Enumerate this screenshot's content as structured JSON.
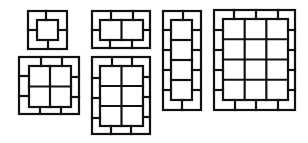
{
  "diagram": {
    "stroke_color": "#111111",
    "background": "#ffffff",
    "figures": [
      {
        "id": "fig-1x1",
        "cols": 1,
        "rows": 1,
        "outer": [
          28,
          11,
          67,
          49
        ],
        "inner": [
          37,
          20,
          58,
          40
        ],
        "border_ticks": {
          "top": [
            46
          ],
          "bottom": [
            48
          ],
          "left": [
            30
          ],
          "right": [
            30
          ]
        }
      },
      {
        "id": "fig-2x1",
        "cols": 2,
        "rows": 1,
        "outer": [
          92,
          11,
          150,
          48
        ],
        "inner": [
          100,
          20,
          143,
          40
        ],
        "border_ticks": {
          "top": [
            111,
            133
          ],
          "bottom": [
            110,
            132
          ],
          "left": [
            30
          ],
          "right": [
            30
          ]
        }
      },
      {
        "id": "fig-2x2",
        "cols": 2,
        "rows": 2,
        "outer": [
          19,
          57,
          79,
          114
        ],
        "inner": [
          29,
          66,
          71,
          107
        ],
        "border_ticks": {
          "top": [
            41,
            62
          ],
          "bottom": [
            40,
            61
          ],
          "left": [
            76,
            96
          ],
          "right": [
            77,
            97
          ]
        }
      },
      {
        "id": "fig-2x3",
        "cols": 2,
        "rows": 3,
        "outer": [
          92,
          57,
          150,
          134
        ],
        "inner": [
          100,
          66,
          143,
          126
        ],
        "border_ticks": {
          "top": [
            112,
            132
          ],
          "bottom": [
            111,
            131
          ],
          "left": [
            78,
            98,
            118
          ],
          "right": [
            77,
            97,
            117
          ]
        }
      },
      {
        "id": "fig-1x4",
        "cols": 1,
        "rows": 4,
        "outer": [
          163,
          11,
          201,
          110
        ],
        "inner": [
          171,
          20,
          192,
          100
        ],
        "border_ticks": {
          "top": [
            183
          ],
          "bottom": [
            182
          ],
          "left": [
            30,
            50,
            70,
            90
          ],
          "right": [
            30,
            50,
            70,
            90
          ]
        }
      },
      {
        "id": "fig-3x4",
        "cols": 3,
        "rows": 4,
        "outer": [
          214,
          10,
          295,
          110
        ],
        "inner": [
          223,
          19,
          288,
          100
        ],
        "border_ticks": {
          "top": [
            234,
            256,
            278
          ],
          "bottom": [
            235,
            256,
            278
          ],
          "left": [
            30,
            50,
            70,
            90
          ],
          "right": [
            30,
            50,
            70,
            90
          ]
        }
      }
    ]
  }
}
